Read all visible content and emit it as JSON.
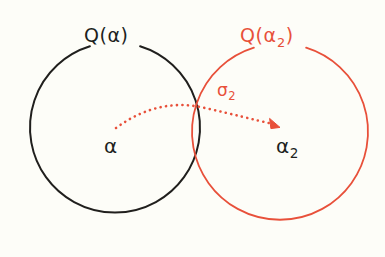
{
  "figure": {
    "background_color": "#fdfdf8",
    "width": 385,
    "height": 257
  },
  "colors": {
    "black_stroke": "#201f1d",
    "red_stroke": "#e8503a",
    "background": "#fdfdf8"
  },
  "sets": {
    "left": {
      "label_main": "Q(",
      "label_arg": "α",
      "label_close": ")",
      "color": "#201f1d",
      "center_x": 115,
      "center_y": 130,
      "radius": 85
    },
    "right": {
      "label_main": "Q(",
      "label_arg": "α",
      "label_sub": "2",
      "label_close": ")",
      "color": "#e8503a",
      "center_x": 280,
      "center_y": 132,
      "radius": 88
    }
  },
  "points": {
    "left": {
      "label": "α",
      "color": "#201f1d",
      "x": 115,
      "y": 148
    },
    "right": {
      "label": "α",
      "label_sub": "2",
      "color": "#201f1d",
      "x": 288,
      "y": 148
    }
  },
  "morphism": {
    "label": "σ",
    "label_sub": "2",
    "color": "#e8503a",
    "style": "dotted-curved-arrow",
    "start_x": 116,
    "start_y": 128,
    "peak_x": 200,
    "peak_y": 107,
    "end_x": 278,
    "end_y": 125
  }
}
